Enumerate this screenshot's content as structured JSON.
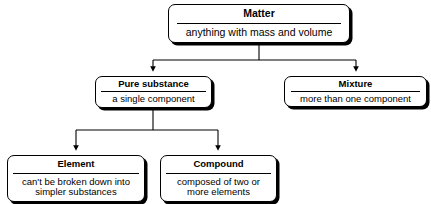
{
  "diagram": {
    "type": "hierarchy-flowchart",
    "colors": {
      "background": "#ffffff",
      "box_fill": "#ffffff",
      "border": "#000000",
      "shadow": "#000000",
      "text": "#000000",
      "connector": "#000000"
    },
    "nodes": {
      "matter": {
        "title": "Matter",
        "body": "anything with mass and volume"
      },
      "pure_substance": {
        "title": "Pure substance",
        "body": "a single component"
      },
      "mixture": {
        "title": "Mixture",
        "body": "more than one component"
      },
      "element": {
        "title": "Element",
        "body_line1": "can't be broken down into",
        "body_line2": "simpler substances"
      },
      "compound": {
        "title": "Compound",
        "body_line1": "composed of two or",
        "body_line2": "more elements"
      }
    },
    "edges": [
      {
        "from": "matter",
        "to": "pure_substance",
        "style": "elbow-arrow"
      },
      {
        "from": "matter",
        "to": "mixture",
        "style": "elbow-arrow"
      },
      {
        "from": "pure_substance",
        "to": "element",
        "style": "elbow-arrow"
      },
      {
        "from": "pure_substance",
        "to": "compound",
        "style": "elbow-arrow"
      }
    ]
  }
}
